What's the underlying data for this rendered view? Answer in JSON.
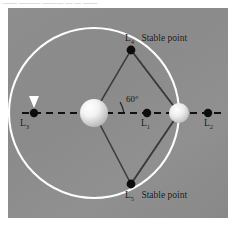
{
  "clipped_caption": "—— ——— ———  — — ——",
  "figure": {
    "panel_background": "#8c8c8c",
    "orbit_color": "#ffffff",
    "axis_color": "#1a1a1a",
    "triangle_color": "#3a3a3a",
    "point_color": "#0d0d0d",
    "primary_body_color": "#efefef",
    "secondary_body_color": "#e2e2e2",
    "angle_label": "60°",
    "labels": {
      "l3": "L",
      "l3_sub": "3",
      "l1": "L",
      "l1_sub": "1",
      "l2": "L",
      "l2_sub": "2",
      "l4": "L",
      "l4_sub": "4",
      "l4_note": "Stable point",
      "l5": "L",
      "l5_sub": "5",
      "l5_note": "Stable point"
    },
    "points": [
      {
        "name": "L3",
        "x": 26,
        "y": 105
      },
      {
        "name": "L1",
        "x": 139,
        "y": 105
      },
      {
        "name": "L2",
        "x": 200,
        "y": 105
      },
      {
        "name": "L4",
        "x": 123,
        "y": 42
      },
      {
        "name": "L5",
        "x": 123,
        "y": 176
      }
    ],
    "bodies": [
      {
        "name": "primary",
        "x": 86,
        "y": 105,
        "r": 14
      },
      {
        "name": "secondary",
        "x": 171,
        "y": 105,
        "r": 10
      }
    ],
    "orbit": {
      "cx": 86,
      "cy": 105,
      "r": 85
    },
    "arrow": {
      "x": 26,
      "y": 95,
      "direction": "down"
    }
  }
}
